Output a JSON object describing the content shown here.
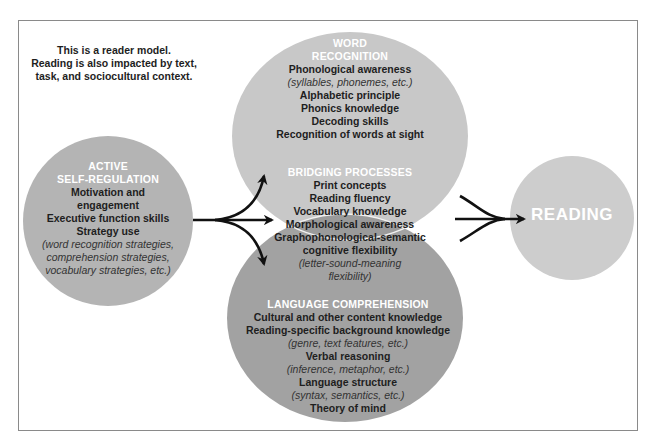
{
  "note": {
    "lines": [
      "This is a reader model.",
      "Reading is also impacted by text,",
      "task, and sociocultural context."
    ]
  },
  "active_self_regulation": {
    "heading": [
      "ACTIVE",
      "SELF-REGULATION"
    ],
    "items": [
      {
        "text": "Motivation and",
        "style": "bold"
      },
      {
        "text": "engagement",
        "style": "bold"
      },
      {
        "text": "Executive function skills",
        "style": "bold"
      },
      {
        "text": "Strategy use",
        "style": "bold"
      },
      {
        "text": "(word recognition strategies,",
        "style": "italic"
      },
      {
        "text": "comprehension strategies,",
        "style": "italic"
      },
      {
        "text": "vocabulary strategies, etc.)",
        "style": "italic"
      }
    ]
  },
  "word_recognition": {
    "heading": [
      "WORD",
      "RECOGNITION"
    ],
    "items": [
      {
        "text": "Phonological awareness",
        "style": "bold"
      },
      {
        "text": "(syllables, phonemes, etc.)",
        "style": "italic"
      },
      {
        "text": "Alphabetic principle",
        "style": "bold"
      },
      {
        "text": "Phonics knowledge",
        "style": "bold"
      },
      {
        "text": "Decoding skills",
        "style": "bold"
      },
      {
        "text": "Recognition of words at sight",
        "style": "bold"
      }
    ]
  },
  "bridging_processes": {
    "heading": [
      "BRIDGING PROCESSES"
    ],
    "items": [
      {
        "text": "Print concepts",
        "style": "bold"
      },
      {
        "text": "Reading fluency",
        "style": "bold"
      },
      {
        "text": "Vocabulary knowledge",
        "style": "bold"
      },
      {
        "text": "Morphological awareness",
        "style": "bold"
      },
      {
        "text": "Graphophonological-semantic",
        "style": "bold"
      },
      {
        "text": "cognitive flexibility",
        "style": "bold"
      },
      {
        "text": "(letter-sound-meaning",
        "style": "italic"
      },
      {
        "text": "flexibility)",
        "style": "italic"
      }
    ]
  },
  "language_comprehension": {
    "heading": [
      "LANGUAGE COMPREHENSION"
    ],
    "items": [
      {
        "text": "Cultural and other content knowledge",
        "style": "bold"
      },
      {
        "text": "Reading-specific background knowledge",
        "style": "bold"
      },
      {
        "text": "(genre, text features, etc.)",
        "style": "italic"
      },
      {
        "text": "Verbal reasoning",
        "style": "bold"
      },
      {
        "text": "(inference, metaphor, etc.)",
        "style": "italic"
      },
      {
        "text": "Language structure",
        "style": "bold"
      },
      {
        "text": "(syntax, semantics, etc.)",
        "style": "italic"
      },
      {
        "text": "Theory of mind",
        "style": "bold"
      }
    ]
  },
  "reading": {
    "label": "READING"
  },
  "colors": {
    "frame": "#8a8a8a",
    "self_regulation_fill": "#b4b4b4",
    "word_recognition_fill": "#c8c8c8",
    "language_comprehension_fill": "#a2a2a2",
    "bridging_fill": "#9a9a9a",
    "reading_fill": "#cdcdcd",
    "heading_text": "#ffffff",
    "body_text": "#1e1e1e",
    "arrow": "#111111"
  }
}
